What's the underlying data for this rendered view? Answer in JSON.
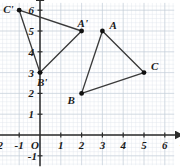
{
  "figure": {
    "type": "coordinate-grid-geometry",
    "background": "#ffffff",
    "grid_color": "#c3ccd6",
    "grid_minor_color": "#dde3ea",
    "axis_color": "#2b2b2b",
    "shape_color": "#3a3a3a",
    "point_color": "#111111"
  },
  "axes": {
    "x": {
      "name": "x",
      "min": -2.4,
      "max": 6.6,
      "ticks": [
        -2,
        -1,
        1,
        2,
        3,
        4,
        5,
        6
      ],
      "tick_labels": [
        "-2",
        "-1",
        "1",
        "2",
        "3",
        "4",
        "5",
        "6"
      ]
    },
    "y": {
      "name": "y",
      "min": -1.4,
      "max": 6.5,
      "ticks": [
        -1,
        1,
        2,
        3,
        4,
        5,
        6
      ],
      "tick_labels": [
        "-1",
        "1",
        "2",
        "3",
        "4",
        "5",
        "6"
      ]
    },
    "origin_label": "O"
  },
  "chart_data": {
    "type": "scatter",
    "title": "",
    "xlabel": "x",
    "ylabel": "y",
    "xlim": [
      -2.4,
      6.6
    ],
    "ylim": [
      -1.4,
      6.5
    ],
    "grid": true,
    "series": [
      {
        "name": "triangle ABC",
        "closed": true,
        "points": [
          {
            "label": "A",
            "x": 3,
            "y": 5,
            "label_dx": 7,
            "label_dy": -11
          },
          {
            "label": "B",
            "x": 2,
            "y": 2,
            "label_dx": -14,
            "label_dy": 2
          },
          {
            "label": "C",
            "x": 5,
            "y": 3,
            "label_dx": 7,
            "label_dy": -12
          }
        ]
      },
      {
        "name": "triangle A'B'C'",
        "closed": true,
        "points": [
          {
            "label": "A'",
            "x": 2,
            "y": 5,
            "label_dx": -4,
            "label_dy": -13
          },
          {
            "label": "B'",
            "x": 0,
            "y": 3,
            "label_dx": -3,
            "label_dy": 4
          },
          {
            "label": "C'",
            "x": -1,
            "y": 6,
            "label_dx": -16,
            "label_dy": -6
          }
        ]
      }
    ]
  }
}
